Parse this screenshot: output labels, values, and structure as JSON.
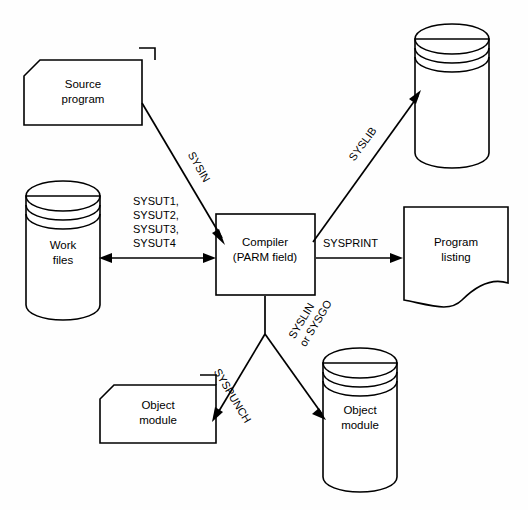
{
  "diagram": {
    "stroke_color": "#000000",
    "background_color": "#ffffff",
    "nodes": [
      {
        "id": "source-program",
        "shape": "punched-card",
        "lines": [
          "Source",
          "program"
        ],
        "x": 83,
        "y": 92
      },
      {
        "id": "work-files",
        "shape": "cylinder",
        "lines": [
          "Work",
          "files"
        ],
        "x": 63,
        "y": 252
      },
      {
        "id": "compiler",
        "shape": "rectangle",
        "lines": [
          "Compiler",
          "(PARM field)"
        ],
        "x": 265,
        "y": 249
      },
      {
        "id": "syslib-library",
        "shape": "cylinder",
        "lines": [],
        "x": 452,
        "y": 100
      },
      {
        "id": "program-listing",
        "shape": "document",
        "lines": [
          "Program",
          "listing"
        ],
        "x": 456,
        "y": 249
      },
      {
        "id": "object-module-card",
        "shape": "punched-card",
        "lines": [
          "Object",
          "module"
        ],
        "x": 158,
        "y": 413
      },
      {
        "id": "object-module-disk",
        "shape": "cylinder",
        "lines": [
          "Object",
          "module"
        ],
        "x": 360,
        "y": 418
      }
    ],
    "flows": [
      {
        "id": "sysin",
        "label": "SYSIN",
        "from": "source-program",
        "to": "compiler",
        "label_x": 190,
        "label_y": 153,
        "label_rotation": 62
      },
      {
        "id": "sysut",
        "label": "SYSUT1,\nSYSUT2,\nSYSUT3,\nSYSUT4",
        "label_lines": [
          "SYSUT1,",
          "SYSUT2,",
          "SYSUT3,",
          "SYSUT4"
        ],
        "from": "work-files",
        "to": "compiler",
        "direction": "bidirectional",
        "label_x": 133,
        "label_y": 202
      },
      {
        "id": "syslib",
        "label": "SYSLIB",
        "from": "compiler",
        "to": "syslib-library",
        "label_x": 356,
        "label_y": 155,
        "label_rotation": -63
      },
      {
        "id": "sysprint",
        "label": "SYSPRINT",
        "from": "compiler",
        "to": "program-listing",
        "label_x": 323,
        "label_y": 244
      },
      {
        "id": "syspunch",
        "label": "SYSPUNCH",
        "from": "compiler",
        "to": "object-module-card",
        "label_x": 225,
        "label_y": 355,
        "label_rotation": 64
      },
      {
        "id": "syslin-or-sysgo",
        "label": "SYSLIN or SYSGO",
        "label_lines": [
          "SYSLIN",
          "or SYSGO"
        ],
        "from": "compiler",
        "to": "object-module-disk",
        "label_x": 300,
        "label_y": 352,
        "label_rotation": -64
      }
    ]
  }
}
